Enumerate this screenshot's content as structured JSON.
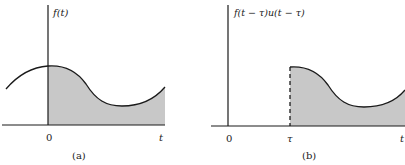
{
  "panels": [
    {
      "id": "a",
      "y_axis_label": "f(t)",
      "x_tick_labels": [
        "0"
      ],
      "x_axis_label": "t",
      "caption": "(a)",
      "description": "Function f(t) with area for t >= 0 shaded"
    },
    {
      "id": "b",
      "y_axis_label": "f(t − τ)u(t − τ)",
      "x_tick_labels": [
        "0",
        "τ"
      ],
      "x_axis_label": "t",
      "caption": "(b)",
      "description": "Shifted and truncated function f(t − τ)u(t − τ), shaded for t >= τ, dashed vertical edge at τ"
    }
  ],
  "colors": {
    "line": "#1a1a1a",
    "fill": "#c8c8c8",
    "background": "#ffffff"
  }
}
